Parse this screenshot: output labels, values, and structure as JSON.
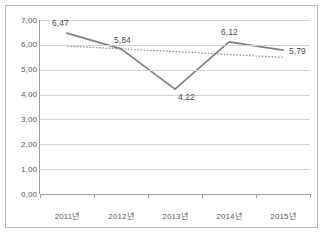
{
  "chart_data": {
    "type": "line",
    "title": "",
    "xlabel": "",
    "ylabel": "",
    "categories": [
      "2011년",
      "2012년",
      "2013년",
      "2014년",
      "2015년"
    ],
    "series": [
      {
        "name": "series-1",
        "values": [
          6.47,
          5.84,
          4.22,
          6.12,
          5.79
        ],
        "value_labels": [
          "6,47",
          "5,84",
          "4,22",
          "6,12",
          "5,79"
        ],
        "style": "solid",
        "color": "#808080"
      },
      {
        "name": "trendline",
        "values": [
          5.95,
          5.84,
          5.73,
          5.61,
          5.5
        ],
        "style": "dotted",
        "color": "#8c8c8c"
      }
    ],
    "ylim": [
      0,
      7
    ],
    "ytick_values": [
      0,
      1,
      2,
      3,
      4,
      5,
      6,
      7
    ],
    "ytick_labels": [
      "0,00",
      "1,00",
      "2,00",
      "3,00",
      "4,00",
      "5,00",
      "6,00",
      "7,00"
    ],
    "grid": true,
    "legend": "none",
    "decimal_separator": ","
  },
  "colors": {
    "series_line": "#808080",
    "trend_line": "#8c8c8c",
    "gridline": "#d2d2d2",
    "axis": "#9d9d9d",
    "frame_border": "#b8b8b8",
    "text": "#58585a",
    "background": "#ffffff"
  }
}
